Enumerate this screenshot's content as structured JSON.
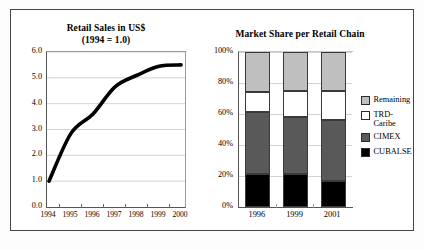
{
  "figure": {
    "background": "#ffffff",
    "frame_color": "#444444"
  },
  "charts": {
    "line": {
      "title": "Retail Sales in US$\n(1994 = 1.0)",
      "yticks": [
        "6.0",
        "5.0",
        "4.0",
        "3.0",
        "2.0",
        "1.0",
        "0.0"
      ],
      "xticks": [
        "1994",
        "1995",
        "1996",
        "1997",
        "1998",
        "1999",
        "2000"
      ]
    },
    "bar": {
      "title": "Market Share per Retail Chain",
      "yticks": [
        "100%",
        "80%",
        "60%",
        "40%",
        "20%",
        "0%"
      ],
      "xticks": [
        "1996",
        "1999",
        "2001"
      ],
      "legend": [
        {
          "label": "Remaining",
          "color": "#bfbfbf"
        },
        {
          "label": "TRD-\nCaribe",
          "color": "#ffffff"
        },
        {
          "label": "CIMEX",
          "color": "#595959"
        },
        {
          "label": "CUBALSE",
          "color": "#000000"
        }
      ]
    }
  },
  "chart_data": [
    {
      "type": "line",
      "title": "Retail Sales in US$ (1994 = 1.0)",
      "subtitle": "(1994 = 1.0)",
      "xlabel": "",
      "ylabel": "",
      "categories": [
        "1994",
        "1995",
        "1996",
        "1997",
        "1998",
        "1999",
        "2000"
      ],
      "values": [
        1.0,
        2.85,
        3.6,
        4.65,
        5.1,
        5.45,
        5.5
      ],
      "ylim": [
        0.0,
        6.0
      ],
      "ytick_step": 1.0,
      "grid": true,
      "legend": "none",
      "line_color": "#000000",
      "line_width": 3.5
    },
    {
      "type": "bar",
      "subtype": "stacked-100-percent",
      "title": "Market Share per Retail Chain",
      "xlabel": "",
      "ylabel": "",
      "categories": [
        "1996",
        "1999",
        "2001"
      ],
      "ylim": [
        0,
        100
      ],
      "ytick_step": 20,
      "grid": true,
      "legend": "right",
      "series": [
        {
          "name": "CUBALSE",
          "color": "#000000",
          "values": [
            21,
            21,
            17
          ]
        },
        {
          "name": "CIMEX",
          "color": "#595959",
          "values": [
            40,
            37,
            39
          ]
        },
        {
          "name": "TRD-Caribe",
          "color": "#ffffff",
          "values": [
            13,
            17,
            19
          ]
        },
        {
          "name": "Remaining",
          "color": "#bfbfbf",
          "values": [
            26,
            25,
            25
          ]
        }
      ]
    }
  ]
}
